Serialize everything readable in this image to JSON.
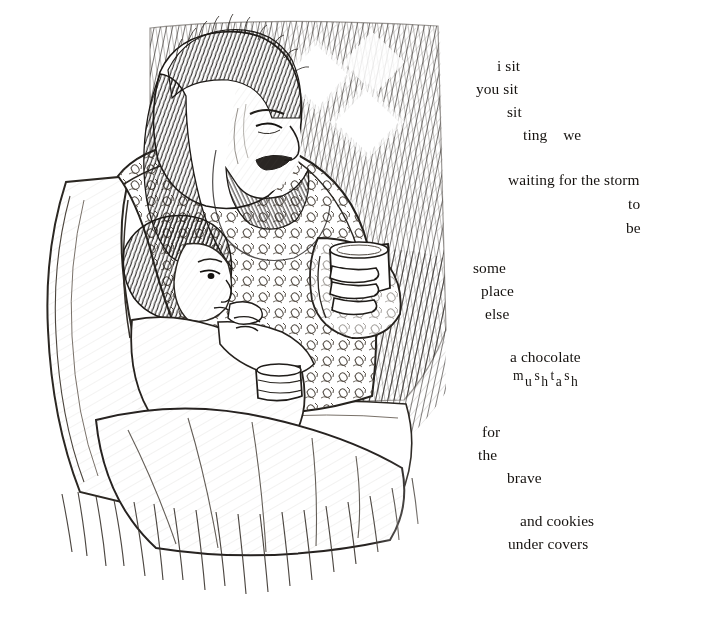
{
  "page": {
    "background_color": "#ffffff",
    "ink_color": "#15120f",
    "width": 706,
    "height": 626
  },
  "illustration": {
    "title": "pen-and-ink drawing of a bearded man holding a child on his lap, both holding mugs, in a chair by a latticed window",
    "medium": "pen and ink crosshatch line drawing",
    "subjects": [
      "bearded long-haired man seated in armchair",
      "young child resting against him",
      "ceramic mug held in the man's hand",
      "second mug held by the child",
      "patterned upholstered armchair",
      "diamond-lattice window with light",
      "blanket draped over laps"
    ]
  },
  "poem": {
    "lines": [
      {
        "text": "i sit",
        "x": 42,
        "y": 0
      },
      {
        "text": "you sit",
        "x": 21,
        "y": 23
      },
      {
        "text": "sit",
        "x": 52,
        "y": 46
      },
      {
        "text": "ting    we",
        "x": 68,
        "y": 69
      },
      {
        "text": "waiting for the storm",
        "x": 53,
        "y": 114
      },
      {
        "text": "to",
        "x": 173,
        "y": 138
      },
      {
        "text": "be",
        "x": 171,
        "y": 162
      },
      {
        "text": "some",
        "x": 18,
        "y": 202
      },
      {
        "text": "place",
        "x": 26,
        "y": 225
      },
      {
        "text": "else",
        "x": 30,
        "y": 248
      },
      {
        "text": "a chocolate",
        "x": 55,
        "y": 291
      },
      {
        "text": "for",
        "x": 27,
        "y": 366
      },
      {
        "text": "the",
        "x": 23,
        "y": 389
      },
      {
        "text": "brave",
        "x": 52,
        "y": 412
      },
      {
        "text": "and cookies",
        "x": 65,
        "y": 455
      },
      {
        "text": "under covers",
        "x": 53,
        "y": 478
      }
    ],
    "scrambled_word": {
      "x": 58,
      "y": 316,
      "word": "mushtash",
      "letters": [
        {
          "char": "m",
          "position": "up"
        },
        {
          "char": "u",
          "position": "down"
        },
        {
          "char": "s",
          "position": "up"
        },
        {
          "char": "h",
          "position": "down"
        },
        {
          "char": "t",
          "position": "up"
        },
        {
          "char": "a",
          "position": "down"
        },
        {
          "char": "s",
          "position": "up"
        },
        {
          "char": "h",
          "position": "down"
        }
      ]
    },
    "full_text": "i sit / you sit / sit / ting we / waiting for the storm / to / be / some / place / else / a chocolate / mushtash / for / the / brave / and cookies / under covers"
  }
}
